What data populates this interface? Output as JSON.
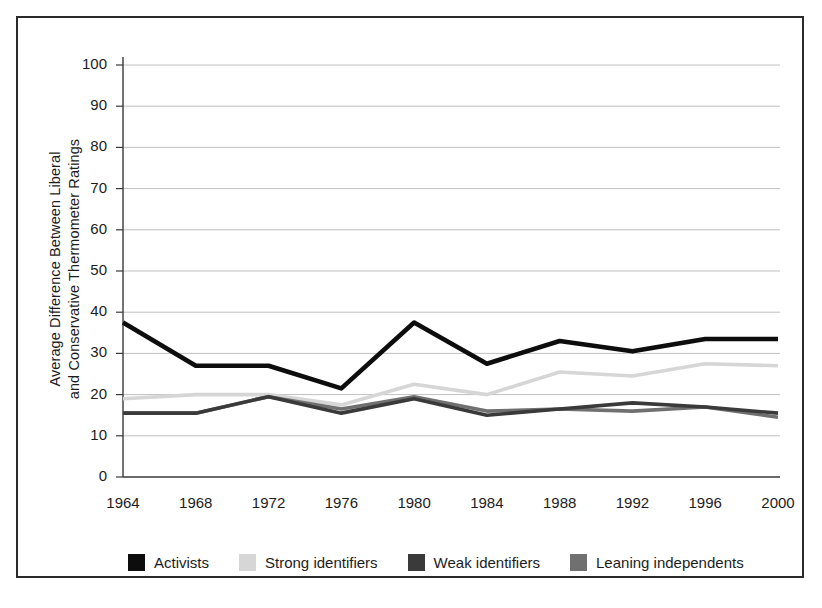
{
  "chart_data": {
    "type": "line",
    "title": "",
    "xlabel": "",
    "ylabel": "Average Difference Between Liberal and Conservative Thermometer Ratings",
    "ylabel_line1": "Average Difference Between Liberal",
    "ylabel_line2": "and Conservative Thermometer Ratings",
    "categories": [
      "1964",
      "1968",
      "1972",
      "1976",
      "1980",
      "1984",
      "1988",
      "1992",
      "1996",
      "2000"
    ],
    "x": [
      1964,
      1968,
      1972,
      1976,
      1980,
      1984,
      1988,
      1992,
      1996,
      2000
    ],
    "ylim": [
      0,
      100
    ],
    "yticks": [
      "0",
      "10",
      "20",
      "30",
      "40",
      "50",
      "60",
      "70",
      "80",
      "90",
      "100"
    ],
    "ytick_values": [
      0,
      10,
      20,
      30,
      40,
      50,
      60,
      70,
      80,
      90,
      100
    ],
    "grid": "horizontal",
    "legend_position": "bottom",
    "series": [
      {
        "name": "Activists",
        "color": "#0d0d0d",
        "values": [
          37.5,
          27.0,
          27.0,
          21.5,
          37.5,
          27.5,
          33.0,
          30.5,
          33.5,
          33.5
        ]
      },
      {
        "name": "Strong identifiers",
        "color": "#d6d6d6",
        "values": [
          19.0,
          20.0,
          20.0,
          17.5,
          22.5,
          20.0,
          25.5,
          24.5,
          27.5,
          27.0
        ]
      },
      {
        "name": "Weak identifiers",
        "color": "#3a3a3a",
        "values": [
          15.5,
          15.5,
          19.5,
          15.5,
          19.0,
          15.0,
          16.5,
          18.0,
          17.0,
          15.5
        ]
      },
      {
        "name": "Leaning independents",
        "color": "#707070",
        "values": [
          15.5,
          15.5,
          19.5,
          16.5,
          19.5,
          16.0,
          16.5,
          16.0,
          17.0,
          14.5
        ]
      }
    ]
  },
  "legend": {
    "items": [
      {
        "label": "Activists",
        "color": "#0d0d0d"
      },
      {
        "label": "Strong identifiers",
        "color": "#d6d6d6"
      },
      {
        "label": "Weak identifiers",
        "color": "#3a3a3a"
      },
      {
        "label": "Leaning independents",
        "color": "#707070"
      }
    ]
  }
}
